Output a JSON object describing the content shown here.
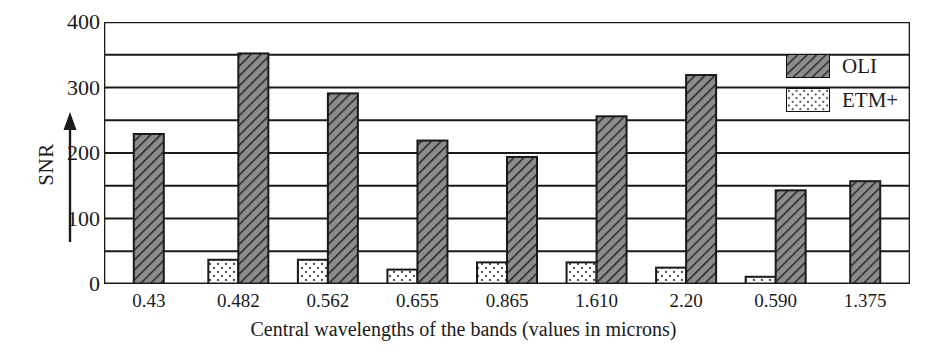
{
  "chart_data": {
    "type": "bar",
    "title": "",
    "xlabel": "Central wavelengths of the bands (values in microns)",
    "ylabel": "SNR",
    "categories": [
      "0.43",
      "0.482",
      "0.562",
      "0.655",
      "0.865",
      "1.610",
      "2.20",
      "0.590",
      "1.375"
    ],
    "ylim": [
      0,
      400
    ],
    "yticks": [
      0,
      100,
      200,
      300,
      400
    ],
    "ytick_labels": [
      "0",
      "100",
      "200",
      "300",
      "400"
    ],
    "gridlines": [
      50,
      100,
      150,
      200,
      250,
      300,
      350,
      400
    ],
    "grid": true,
    "legend_position": "top-right",
    "series": [
      {
        "name": "ETM+",
        "pattern": "dotted",
        "fill": "#ffffff",
        "values": [
          null,
          37,
          37,
          22,
          33,
          33,
          25,
          11,
          null
        ]
      },
      {
        "name": "OLI",
        "pattern": "diagonal-hatch",
        "fill": "#8c8c8c",
        "values": [
          229,
          352,
          291,
          219,
          194,
          256,
          319,
          143,
          157
        ]
      }
    ]
  },
  "axes": {
    "y_title": "SNR",
    "x_title": "Central wavelengths of the bands (values in microns)",
    "y_tick_labels": [
      "400",
      "300",
      "200",
      "100",
      "0"
    ],
    "x_tick_labels": [
      "0.43",
      "0.482",
      "0.562",
      "0.655",
      "0.865",
      "1.610",
      "2.20",
      "0.590",
      "1.375"
    ]
  },
  "legend": {
    "items": [
      {
        "label": "OLI",
        "pattern": "diagonal-hatch"
      },
      {
        "label": "ETM+",
        "pattern": "dotted"
      }
    ]
  },
  "colors": {
    "axis": "#1a1a1a",
    "grid": "#1a1a1a",
    "oli_fill": "#8c8c8c",
    "oli_hatch": "#2a2a2a",
    "etm_fill": "#ffffff",
    "etm_dots": "#555555",
    "background": "#ffffff"
  }
}
